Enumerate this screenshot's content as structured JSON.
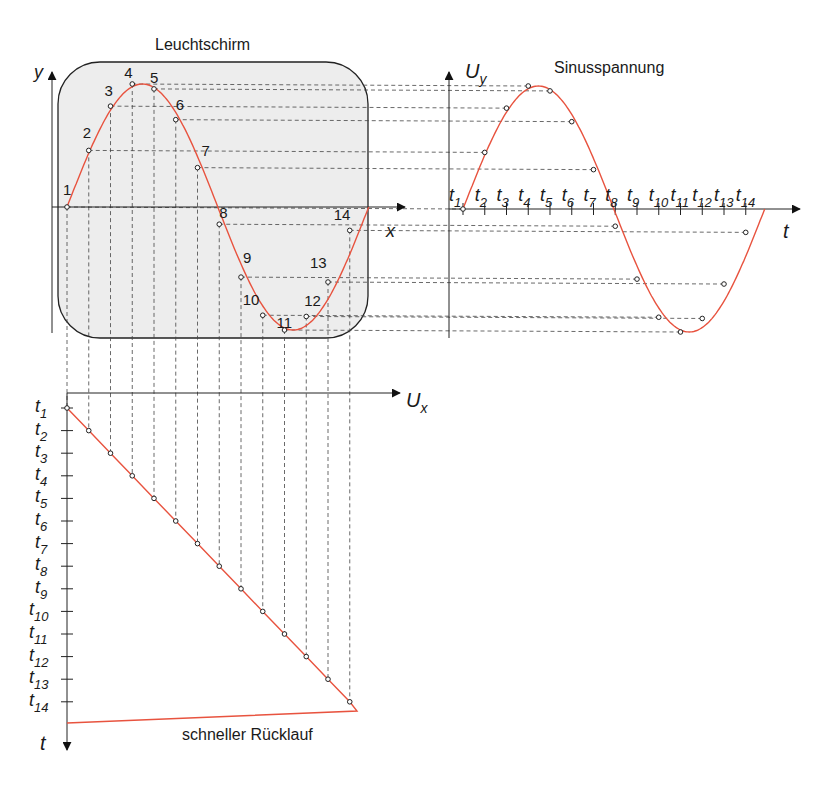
{
  "titles": {
    "screen": "Leuchtschirm",
    "sine": "Sinusspannung",
    "ramp_return": "schneller Rücklauf"
  },
  "axes": {
    "screen_y": "y",
    "screen_x": "x",
    "sine_y": "U",
    "sine_y_sub": "y",
    "sine_x": "t",
    "ramp_x": "U",
    "ramp_x_sub": "x",
    "ramp_y": "t"
  },
  "colors": {
    "curve": "#e8533f",
    "screen_fill": "#ededed",
    "axis": "#222222",
    "guide": "#444444"
  },
  "points": [
    "1",
    "2",
    "3",
    "4",
    "5",
    "6",
    "7",
    "8",
    "9",
    "10",
    "11",
    "12",
    "13",
    "14"
  ],
  "time_labels": [
    "t1",
    "t2",
    "t3",
    "t4",
    "t5",
    "t6",
    "t7",
    "t8",
    "t9",
    "t10",
    "t11",
    "t12",
    "t13",
    "t14"
  ],
  "chart_data": [
    {
      "type": "line",
      "title": "Leuchtschirm",
      "xlabel": "x",
      "ylabel": "y",
      "x": [
        1,
        2,
        3,
        4,
        5,
        6,
        7,
        8,
        9,
        10,
        11,
        12,
        13,
        14
      ],
      "series": [
        {
          "name": "Bildpunkte",
          "values": [
            0,
            0.46,
            0.82,
            1.0,
            0.96,
            0.71,
            0.32,
            -0.14,
            -0.57,
            -0.88,
            -1.0,
            -0.89,
            -0.61,
            -0.19
          ]
        }
      ],
      "grid": false
    },
    {
      "type": "line",
      "title": "Sinusspannung",
      "xlabel": "t",
      "ylabel": "U_y",
      "categories": [
        "t1",
        "t2",
        "t3",
        "t4",
        "t5",
        "t6",
        "t7",
        "t8",
        "t9",
        "t10",
        "t11",
        "t12",
        "t13",
        "t14"
      ],
      "series": [
        {
          "name": "U_y",
          "values": [
            0,
            0.46,
            0.82,
            1.0,
            0.96,
            0.71,
            0.32,
            -0.14,
            -0.57,
            -0.88,
            -1.0,
            -0.89,
            -0.61,
            -0.19
          ]
        }
      ],
      "grid": false
    },
    {
      "type": "line",
      "title": "Sägezahnspannung",
      "xlabel": "U_x",
      "ylabel": "t",
      "categories": [
        "t1",
        "t2",
        "t3",
        "t4",
        "t5",
        "t6",
        "t7",
        "t8",
        "t9",
        "t10",
        "t11",
        "t12",
        "t13",
        "t14"
      ],
      "series": [
        {
          "name": "U_x",
          "values": [
            0,
            1,
            2,
            3,
            4,
            5,
            6,
            7,
            8,
            9,
            10,
            11,
            12,
            13
          ]
        }
      ],
      "annotations": [
        "schneller Rücklauf"
      ],
      "grid": false
    }
  ]
}
